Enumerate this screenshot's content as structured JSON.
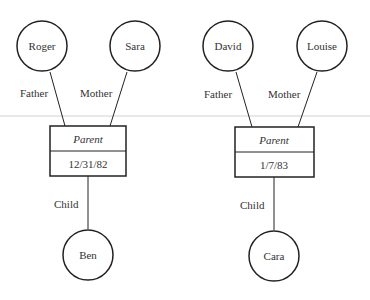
{
  "diagram": {
    "groups": [
      {
        "father": "Roger",
        "mother": "Sara",
        "father_label": "Father",
        "mother_label": "Mother",
        "relation_title": "Parent",
        "relation_value": "12/31/82",
        "child_label": "Child",
        "child": "Ben"
      },
      {
        "father": "David",
        "mother": "Louise",
        "father_label": "Father",
        "mother_label": "Mother",
        "relation_title": "Parent",
        "relation_value": "1/7/83",
        "child_label": "Child",
        "child": "Cara"
      }
    ]
  },
  "colors": {
    "stroke": "#222222",
    "text": "#333333",
    "background": "#ffffff"
  }
}
